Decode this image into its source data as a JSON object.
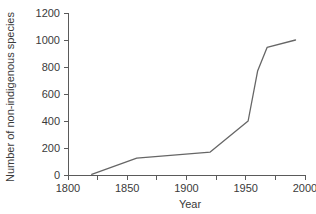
{
  "chart_data": {
    "type": "line",
    "title": "",
    "subtitle": "",
    "xlabel": "Year",
    "ylabel": "Number of non-indigenous species",
    "xlim": [
      1800,
      2000
    ],
    "ylim": [
      0,
      1200
    ],
    "grid": false,
    "legend": false,
    "legend_position": "none",
    "line_color": "#666666",
    "axis_color": "#5a5a5a",
    "background_color": "#ffffff",
    "x_ticks_major": [
      1800,
      1850,
      1900,
      1950,
      2000
    ],
    "x_tick_labels": [
      "1800",
      "1850",
      "1900",
      "1950",
      "2000"
    ],
    "x_ticks_minor": [
      1825,
      1875,
      1925,
      1975
    ],
    "y_ticks": [
      0,
      200,
      400,
      600,
      800,
      1000,
      1200
    ],
    "y_tick_labels": [
      "0",
      "200",
      "400",
      "600",
      "800",
      "1000",
      "1200"
    ],
    "series": [
      {
        "name": "Non-indigenous species",
        "x": [
          1820,
          1858,
          1920,
          1952,
          1960,
          1968,
          1992
        ],
        "values": [
          5,
          125,
          170,
          400,
          770,
          945,
          1000
        ]
      }
    ]
  }
}
